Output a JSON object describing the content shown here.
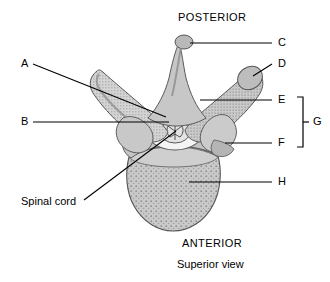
{
  "figure": {
    "title_top": "POSTERIOR",
    "title_bottom": "ANTERIOR",
    "caption": "Superior view",
    "colors": {
      "ink": "#000000",
      "background": "#ffffff",
      "bone_light": "#d9d9d9",
      "bone_mid": "#bdbdbd",
      "bone_dark": "#9a9a9a",
      "outline": "#4a4a4a",
      "foramen": "#f2f2f2"
    }
  },
  "labels": {
    "a": "A",
    "b": "B",
    "c": "C",
    "d": "D",
    "e": "E",
    "f": "F",
    "g": "G",
    "h": "H",
    "spinal_cord": "Spinal cord"
  }
}
